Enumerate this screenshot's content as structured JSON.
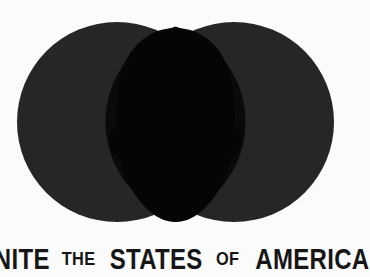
{
  "poster": {
    "background_color": "#fbfbfb",
    "caption": {
      "full_text": "UNITE THE STATES OF AMERICA",
      "words": [
        {
          "text": "UNITE",
          "size": "large"
        },
        {
          "text": "THE",
          "size": "small"
        },
        {
          "text": "STATES",
          "size": "large"
        },
        {
          "text": "OF",
          "size": "small"
        },
        {
          "text": "AMERICA",
          "size": "large"
        }
      ],
      "text_color": "#161616"
    },
    "artwork": {
      "title": "venn-diagram-head-silhouette",
      "circle_color": "#262626",
      "overlap_color": "#050505",
      "silhouette_color": "#050505",
      "left_circle": {
        "cx": 117,
        "cy": 122,
        "r": 100
      },
      "right_circle": {
        "cx": 234,
        "cy": 122,
        "r": 100
      },
      "head": {
        "cx": 175,
        "top": 28,
        "bottom": 222
      }
    }
  }
}
